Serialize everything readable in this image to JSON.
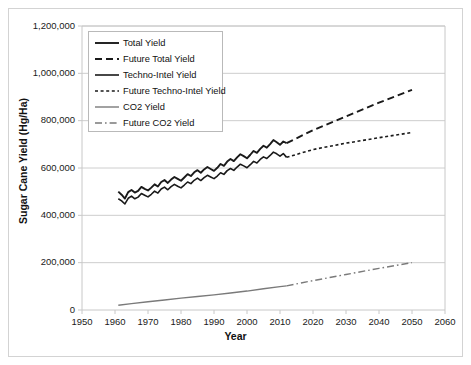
{
  "chart_data": {
    "type": "line",
    "title": "",
    "xlabel": "Year",
    "ylabel": "Sugar Cane Yield (Hg/Ha)",
    "xlim": [
      1950,
      2060
    ],
    "ylim": [
      0,
      1200000
    ],
    "xticks": [
      1950,
      1960,
      1970,
      1980,
      1990,
      2000,
      2010,
      2020,
      2030,
      2040,
      2050,
      2060
    ],
    "xtick_labels": [
      "1950",
      "1960",
      "1970",
      "1980",
      "1990",
      "2000",
      "2010",
      "2020",
      "2030",
      "2040",
      "2050",
      "2060"
    ],
    "yticks": [
      0,
      200000,
      400000,
      600000,
      800000,
      1000000,
      1200000
    ],
    "ytick_labels": [
      "0",
      "200,000",
      "400,000",
      "600,000",
      "800,000",
      "1,000,000",
      "1,200,000"
    ],
    "grid": "horizontal",
    "legend_position": "upper-left-inside",
    "series": [
      {
        "name": "Total Yield",
        "style": "solid",
        "color": "#1a1a1a",
        "width": 1.9,
        "x": [
          1961,
          1962,
          1963,
          1964,
          1965,
          1966,
          1967,
          1968,
          1969,
          1970,
          1971,
          1972,
          1973,
          1974,
          1975,
          1976,
          1977,
          1978,
          1979,
          1980,
          1981,
          1982,
          1983,
          1984,
          1985,
          1986,
          1987,
          1988,
          1989,
          1990,
          1991,
          1992,
          1993,
          1994,
          1995,
          1996,
          1997,
          1998,
          1999,
          2000,
          2001,
          2002,
          2003,
          2004,
          2005,
          2006,
          2007,
          2008,
          2009,
          2010,
          2011,
          2012
        ],
        "values": [
          500000,
          487000,
          471000,
          498000,
          507000,
          496000,
          503000,
          520000,
          512000,
          505000,
          517000,
          531000,
          522000,
          541000,
          549000,
          537000,
          551000,
          562000,
          554000,
          546000,
          560000,
          574000,
          566000,
          582000,
          591000,
          580000,
          594000,
          604000,
          596000,
          588000,
          601000,
          617000,
          609000,
          627000,
          638000,
          629000,
          645000,
          658000,
          650000,
          641000,
          656000,
          672000,
          664000,
          681000,
          694000,
          686000,
          701000,
          718000,
          709000,
          698000,
          712000,
          705000
        ]
      },
      {
        "name": "Future Total Yield",
        "style": "dashed",
        "color": "#1a1a1a",
        "width": 1.9,
        "x": [
          2012,
          2020,
          2030,
          2040,
          2050
        ],
        "values": [
          705000,
          760000,
          818000,
          876000,
          930000
        ]
      },
      {
        "name": "Techno-Intel Yield",
        "style": "solid",
        "color": "#1a1a1a",
        "width": 1.6,
        "x": [
          1961,
          1962,
          1963,
          1964,
          1965,
          1966,
          1967,
          1968,
          1969,
          1970,
          1971,
          1972,
          1973,
          1974,
          1975,
          1976,
          1977,
          1978,
          1979,
          1980,
          1981,
          1982,
          1983,
          1984,
          1985,
          1986,
          1987,
          1988,
          1989,
          1990,
          1991,
          1992,
          1993,
          1994,
          1995,
          1996,
          1997,
          1998,
          1999,
          2000,
          2001,
          2002,
          2003,
          2004,
          2005,
          2006,
          2007,
          2008,
          2009,
          2010,
          2011,
          2012
        ],
        "values": [
          470000,
          461000,
          448000,
          472000,
          481000,
          470000,
          477000,
          492000,
          485000,
          478000,
          489000,
          502000,
          494000,
          511000,
          519000,
          508000,
          521000,
          531000,
          523000,
          516000,
          528000,
          541000,
          534000,
          548000,
          557000,
          547000,
          559000,
          569000,
          562000,
          555000,
          566000,
          580000,
          573000,
          589000,
          598000,
          590000,
          604000,
          616000,
          609000,
          601000,
          614000,
          628000,
          621000,
          636000,
          647000,
          640000,
          653000,
          667000,
          660000,
          650000,
          661000,
          645000
        ]
      },
      {
        "name": "Future Techno-Intel Yield",
        "style": "dotted-dash",
        "color": "#1a1a1a",
        "width": 1.6,
        "x": [
          2012,
          2020,
          2030,
          2040,
          2050
        ],
        "values": [
          645000,
          678000,
          705000,
          728000,
          750000
        ]
      },
      {
        "name": "CO2 Yield",
        "style": "solid",
        "color": "#7a7a7a",
        "width": 1.4,
        "x": [
          1961,
          1965,
          1970,
          1975,
          1980,
          1985,
          1990,
          1995,
          2000,
          2005,
          2010,
          2012
        ],
        "values": [
          20000,
          27000,
          35000,
          42000,
          50000,
          57000,
          64000,
          72000,
          80000,
          90000,
          99000,
          102000
        ]
      },
      {
        "name": "Future CO2 Yield",
        "style": "dash-dot",
        "color": "#7a7a7a",
        "width": 1.4,
        "x": [
          2012,
          2020,
          2030,
          2040,
          2050
        ],
        "values": [
          102000,
          124000,
          150000,
          176000,
          200000
        ]
      }
    ]
  },
  "axes": {
    "x_title": "Year",
    "y_title": "Sugar Cane Yield (Hg/Ha)"
  },
  "legend": {
    "items": [
      {
        "label": "Total Yield",
        "style": "solid",
        "color": "#1a1a1a"
      },
      {
        "label": "Future Total Yield",
        "style": "dashed",
        "color": "#1a1a1a"
      },
      {
        "label": "Techno-Intel Yield",
        "style": "solid",
        "color": "#1a1a1a"
      },
      {
        "label": "Future Techno-Intel Yield",
        "style": "dotted-dash",
        "color": "#1a1a1a"
      },
      {
        "label": "CO2 Yield",
        "style": "solid",
        "color": "#7a7a7a"
      },
      {
        "label": "Future CO2 Yield",
        "style": "dash-dot",
        "color": "#7a7a7a"
      }
    ]
  },
  "colors": {
    "primary_line": "#1a1a1a",
    "secondary_line": "#7a7a7a",
    "gridline": "#c8c8c8",
    "frame": "#d3d3d3",
    "text": "#111111"
  }
}
